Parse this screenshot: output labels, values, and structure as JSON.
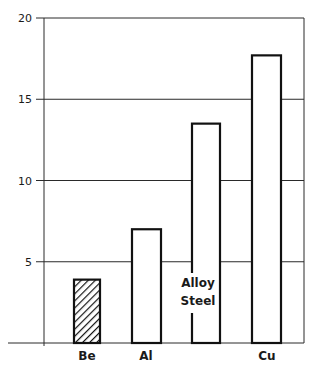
{
  "chart_data": {
    "type": "bar",
    "title": "",
    "xlabel": "",
    "ylabel": "",
    "categories": [
      "Be",
      "Al",
      "Alloy Steel",
      "Cu"
    ],
    "category_label_lines": [
      [
        "Be"
      ],
      [
        "Al"
      ],
      [
        "Alloy",
        "Steel"
      ],
      [
        "Cu"
      ]
    ],
    "values": [
      3.9,
      7.0,
      13.5,
      17.7
    ],
    "bar_styles": [
      "hatched",
      "open",
      "open",
      "open"
    ],
    "ylim": [
      0,
      20
    ],
    "yticks": [
      5,
      10,
      15,
      20
    ],
    "ytick_labels": [
      "5",
      "10",
      "15",
      "20"
    ],
    "grid": true,
    "legend": null,
    "colors": {
      "stroke": "#111111",
      "fill": "#ffffff",
      "grid": "#2a2a2a"
    }
  },
  "layout": {
    "plot_left": 44,
    "plot_right": 304,
    "plot_top": 18,
    "plot_bottom": 343,
    "bars": [
      {
        "x0": 74,
        "x1": 100
      },
      {
        "x0": 132,
        "x1": 161
      },
      {
        "x0": 192,
        "x1": 220
      },
      {
        "x0": 252,
        "x1": 281
      }
    ],
    "label_positions": [
      {
        "x": 87,
        "y": 360
      },
      {
        "x": 146,
        "y": 360
      },
      {
        "x": 198,
        "y": 287
      },
      {
        "x": 267,
        "y": 360
      }
    ]
  }
}
